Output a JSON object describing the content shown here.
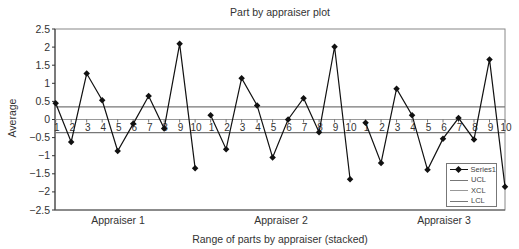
{
  "chart_data": {
    "type": "line",
    "title": "Part by appraiser plot",
    "xlabel": "Range of parts by appraiser (stacked)",
    "ylabel": "Average",
    "ylim": [
      -2.5,
      2.5
    ],
    "yticks": [
      2.5,
      2,
      1.5,
      1,
      0.5,
      0,
      -0.5,
      -1,
      -1.5,
      -2,
      -2.5
    ],
    "ytick_labels": [
      "2.5",
      "2",
      "1.5",
      "1",
      "0.5",
      "0",
      "-0.5",
      "-1",
      "-1.5",
      "-2",
      "-2.5"
    ],
    "groups": [
      "Appraiser 1",
      "Appraiser 2",
      "Appraiser 3"
    ],
    "categories": [
      "1",
      "2",
      "3",
      "4",
      "5",
      "6",
      "7",
      "8",
      "9",
      "10",
      "1",
      "2",
      "3",
      "4",
      "5",
      "6",
      "7",
      "8",
      "9",
      "10",
      "1",
      "2",
      "3",
      "4",
      "5",
      "6",
      "7",
      "8",
      "9",
      "10"
    ],
    "series": [
      {
        "name": "Series1",
        "marker": "diamond",
        "color": "#111111",
        "values": [
          0.45,
          -0.62,
          1.27,
          0.53,
          -0.87,
          -0.12,
          0.65,
          -0.25,
          2.09,
          -1.35,
          0.12,
          -0.82,
          1.14,
          0.39,
          -1.05,
          0.0,
          0.59,
          -0.35,
          2.01,
          -1.65,
          -0.09,
          -1.2,
          0.85,
          0.12,
          -1.39,
          -0.53,
          0.04,
          -0.55,
          1.66,
          -1.86
        ]
      },
      {
        "name": "UCL",
        "color": "#777777",
        "value": 0.35
      },
      {
        "name": "XCL",
        "color": "#999999",
        "value": 0.0
      },
      {
        "name": "LCL",
        "color": "#777777",
        "value": -0.36
      }
    ],
    "legend_position": "lower right (inside plot)",
    "grid": false
  },
  "legend": {
    "items": [
      {
        "label": "Series1",
        "type": "marker-line"
      },
      {
        "label": "UCL",
        "type": "line"
      },
      {
        "label": "XCL",
        "type": "line"
      },
      {
        "label": "LCL",
        "type": "line"
      }
    ]
  }
}
